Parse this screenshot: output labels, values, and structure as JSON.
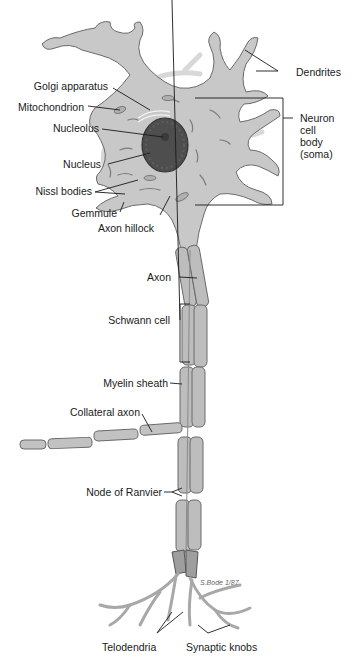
{
  "figure": {
    "colors": {
      "cell_fill": "#c9c9c9",
      "cell_dark": "#9a9a9a",
      "nucleus": "#4a4a4a",
      "outline": "#5a5a5a",
      "leader": "#1a1a1a",
      "background": "#ffffff"
    }
  },
  "labels": {
    "golgi": "Golgi apparatus",
    "mitochondrion": "Mitochondrion",
    "nucleolus": "Nucleolus",
    "nucleus": "Nucleus",
    "nissl": "Nissl bodies",
    "gemmule": "Gemmule",
    "axon_hillock": "Axon hillock",
    "dendrites": "Dendrites",
    "soma": "Neuron\ncell\nbody\n(soma)",
    "axon": "Axon",
    "schwann": "Schwann cell",
    "myelin": "Myelin sheath",
    "collateral": "Collateral axon",
    "ranvier": "Node of Ranvier",
    "telodendria": "Telodendria",
    "synaptic_knobs": "Synaptic knobs"
  },
  "signature": "S.Bode 1/87"
}
